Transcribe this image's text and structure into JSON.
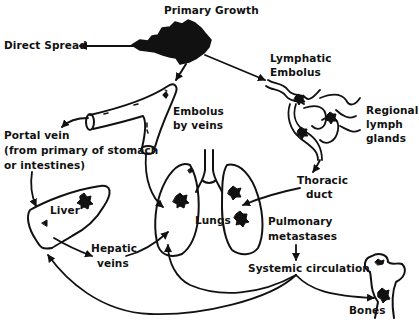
{
  "labels": {
    "primary_growth": "Primary Growth",
    "direct_spread": "Direct Spread",
    "lymphatic_embolus_1": "Lymphatic",
    "lymphatic_embolus_2": "Embolus",
    "regional_1": "Regional",
    "regional_2": "lymph",
    "regional_3": "glands",
    "embolus_veins_1": "Embolus",
    "embolus_veins_2": "by veins",
    "portal_1": "Portal vein",
    "portal_2": "(from primary of stomach",
    "portal_3": "or intestines)",
    "liver": "Liver",
    "lungs": "Lungs",
    "thoracic_1": "Thoracic",
    "thoracic_2": "duct",
    "hepatic_1": "Hepatic",
    "hepatic_2": "veins",
    "pulmonary_1": "Pulmonary",
    "pulmonary_2": "metastases",
    "systemic": "Systemic circulation",
    "bones": "Bones"
  },
  "colors": {
    "ink": "#111111",
    "background": "#ffffff"
  }
}
